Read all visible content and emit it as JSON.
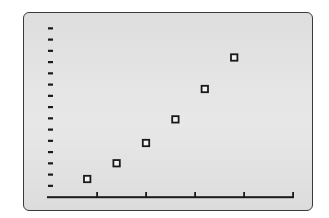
{
  "colors": {
    "page_background": "#ffffff",
    "screen_background": "#e2e2e2",
    "screen_border": "#3a3a3a",
    "ink": "#1a1a1a"
  },
  "chart_data": {
    "type": "scatter",
    "title": "",
    "xlabel": "",
    "ylabel": "",
    "marker": "hollow-square",
    "grid": false,
    "legend": null,
    "x_ticks": 5,
    "x_tick_interval": 5,
    "xlim": [
      0,
      25
    ],
    "y_ticks": 15,
    "y_tick_interval": 1,
    "ylim": [
      0,
      16
    ],
    "tick_labels_visible": false,
    "points": [
      {
        "x": 4,
        "y": 1.6
      },
      {
        "x": 7,
        "y": 3.0
      },
      {
        "x": 10,
        "y": 4.8
      },
      {
        "x": 13,
        "y": 6.9
      },
      {
        "x": 16,
        "y": 9.6
      },
      {
        "x": 19,
        "y": 12.4
      }
    ]
  }
}
